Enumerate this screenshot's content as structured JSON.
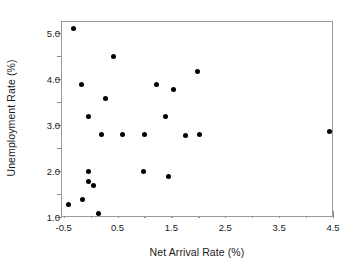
{
  "chart_data": {
    "type": "scatter",
    "title": "",
    "xlabel": "Net Arrival Rate (%)",
    "ylabel": "Unemployment Rate (%)",
    "xlim": [
      -0.55,
      4.5
    ],
    "ylim": [
      1.0,
      5.25
    ],
    "grid": false,
    "legend": null,
    "marker": {
      "shape": "circle",
      "color": "#000000",
      "size_px": 5
    },
    "frame_color": "#9a9a9a",
    "xticks": [
      -0.5,
      0.5,
      1.5,
      2.5,
      3.5,
      4.5
    ],
    "xticklabels": [
      "-0.5",
      "0.5",
      "1.5",
      "2.5",
      "3.5",
      "4.5"
    ],
    "xminorticks": [
      0.0,
      1.0,
      2.0,
      3.0,
      4.0
    ],
    "yticks": [
      1.0,
      2.0,
      3.0,
      4.0,
      5.0
    ],
    "yticklabels": [
      "1.0",
      "2.0",
      "3.0",
      "4.0",
      "5.0"
    ],
    "yminorticks": [
      1.5,
      2.5,
      3.5,
      4.5
    ],
    "points": [
      {
        "x": -0.33,
        "y": 5.1
      },
      {
        "x": -0.43,
        "y": 1.3
      },
      {
        "x": -0.18,
        "y": 3.9
      },
      {
        "x": -0.17,
        "y": 1.4
      },
      {
        "x": -0.06,
        "y": 3.2
      },
      {
        "x": -0.06,
        "y": 2.0
      },
      {
        "x": -0.05,
        "y": 1.8
      },
      {
        "x": 0.04,
        "y": 1.7
      },
      {
        "x": 0.13,
        "y": 1.1
      },
      {
        "x": 0.18,
        "y": 2.8
      },
      {
        "x": 0.25,
        "y": 3.6
      },
      {
        "x": 0.4,
        "y": 4.5
      },
      {
        "x": 0.57,
        "y": 2.8
      },
      {
        "x": 0.97,
        "y": 2.0
      },
      {
        "x": 0.98,
        "y": 2.8
      },
      {
        "x": 1.2,
        "y": 3.9
      },
      {
        "x": 1.38,
        "y": 3.2
      },
      {
        "x": 1.42,
        "y": 1.9
      },
      {
        "x": 1.52,
        "y": 3.78
      },
      {
        "x": 1.75,
        "y": 2.78
      },
      {
        "x": 1.96,
        "y": 4.18
      },
      {
        "x": 2.0,
        "y": 2.8
      },
      {
        "x": 4.42,
        "y": 2.88
      }
    ]
  }
}
